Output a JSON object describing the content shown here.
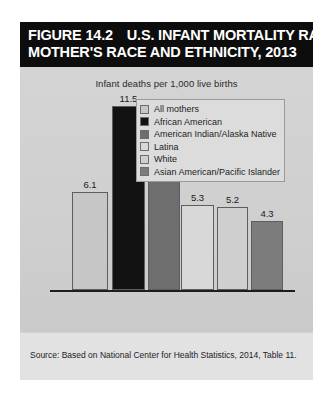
{
  "figure": {
    "number_label": "FIGURE 14.2",
    "title_line1": "U.S. INFANT MORTALITY RATES BY",
    "title_line2": "MOTHER'S RACE AND ETHNICITY, 2013",
    "subtitle": "Infant deaths per 1,000 live births",
    "source": "Source: Based on National Center for Health Statistics, 2014, Table 11."
  },
  "legend": {
    "items": [
      {
        "label": "All mothers",
        "color": "#c6c6c6"
      },
      {
        "label": "African American",
        "color": "#121212"
      },
      {
        "label": "American Indian/Alaska Native",
        "color": "#6e6e6e"
      },
      {
        "label": "Latina",
        "color": "#d8d8d8"
      },
      {
        "label": "White",
        "color": "#cfcfcf"
      },
      {
        "label": "Asian American/Pacific Islander",
        "color": "#7c7c7c"
      }
    ]
  },
  "chart_data": {
    "type": "bar",
    "title": "U.S. INFANT MORTALITY RATES BY MOTHER'S RACE AND ETHNICITY, 2013",
    "subtitle": "Infant deaths per 1,000 live births",
    "xlabel": "",
    "ylabel": "Infant deaths per 1,000 live births",
    "ylim": [
      0,
      12.5
    ],
    "grid": false,
    "legend_position": "top-right",
    "categories": [
      "All mothers",
      "African American",
      "American Indian/Alaska Native",
      "Latina",
      "White",
      "Asian American/Pacific Islander"
    ],
    "values": [
      6.1,
      11.5,
      8.3,
      5.3,
      5.2,
      4.3
    ],
    "value_labels": [
      "6.1",
      "11.5",
      "8.3",
      "5.3",
      "5.2",
      "4.3"
    ],
    "colors": [
      "#c6c6c6",
      "#121212",
      "#6e6e6e",
      "#d8d8d8",
      "#cfcfcf",
      "#7c7c7c"
    ],
    "source": "Source: Based on National Center for Health Statistics, 2014, Table 11."
  }
}
